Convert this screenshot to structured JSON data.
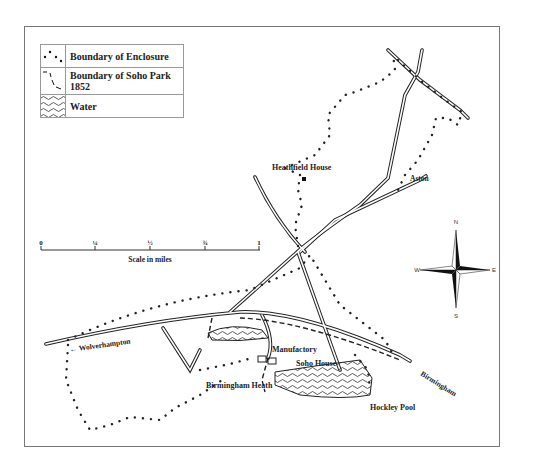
{
  "legend": {
    "items": [
      {
        "symbol": "dotted-boundary",
        "label": "Boundary of Enclosure"
      },
      {
        "symbol": "dashed-boundary",
        "label": "Boundary of Soho Park 1852"
      },
      {
        "symbol": "water-waves",
        "label": "Water"
      }
    ]
  },
  "scale": {
    "ticks": [
      "0",
      "¼",
      "½",
      "¾",
      "1"
    ],
    "label": "Scale in miles"
  },
  "compass": {
    "n": "N",
    "s": "S",
    "e": "E",
    "w": "W"
  },
  "places": {
    "heathfield_house": "Heathfield House",
    "aston": "Aston",
    "wolverhampton": "← Wolverhampton",
    "manufactory": "Manufactory",
    "soho_house": "Soho House",
    "birmingham_heath": "Birmingham Heath",
    "hockley_pool": "Hockley Pool",
    "birmingham": "Birmingham"
  },
  "colors": {
    "ink": "#222222",
    "frame": "#777777",
    "background": "#ffffff"
  }
}
